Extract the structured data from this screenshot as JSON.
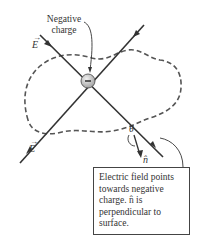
{
  "diagram": {
    "labels": {
      "charge_label": "Negative charge",
      "charge_symbol": "−",
      "field_top": "E",
      "field_bottom": "E",
      "vector_arrow": "→",
      "angle": "θ",
      "normal": "n̂",
      "callout": "Electric field points towards negative charge. n̂ is perpendicular to surface."
    },
    "colors": {
      "lines": "#333333",
      "dashed_surface": "#555555",
      "charge_fill": "#bdbdbd",
      "box_border": "#444444"
    }
  }
}
